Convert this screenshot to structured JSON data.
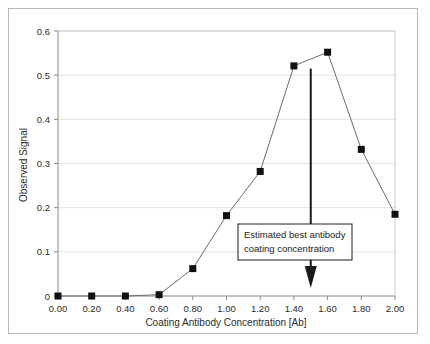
{
  "chart_data": {
    "type": "line",
    "title": "",
    "xlabel": "Coating Antibody Concentration [Ab]",
    "ylabel": "Observed Signal",
    "x": [
      0.0,
      0.2,
      0.4,
      0.6,
      0.8,
      1.0,
      1.2,
      1.4,
      1.6,
      1.8,
      2.0
    ],
    "values": [
      0.0,
      0.0,
      0.0,
      0.003,
      0.062,
      0.182,
      0.282,
      0.521,
      0.552,
      0.332,
      0.185
    ],
    "series": [
      {
        "name": "Observed Signal",
        "values": [
          0.0,
          0.0,
          0.0,
          0.003,
          0.062,
          0.182,
          0.282,
          0.521,
          0.552,
          0.332,
          0.185
        ]
      }
    ],
    "xlim": [
      0.0,
      2.0
    ],
    "ylim": [
      0.0,
      0.6
    ],
    "xticks": [
      "0.00",
      "0.20",
      "0.40",
      "0.60",
      "0.80",
      "1.00",
      "1.20",
      "1.40",
      "1.60",
      "1.80",
      "2.00"
    ],
    "yticks": [
      "0",
      "0.1",
      "0.2",
      "0.3",
      "0.4",
      "0.5",
      "0.6"
    ],
    "ytick_values": [
      0.0,
      0.1,
      0.2,
      0.3,
      0.4,
      0.5,
      0.6
    ],
    "grid": "horizontal",
    "legend": "none",
    "marker": "square",
    "marker_color": "#111111",
    "line_color": "#6b6b6b",
    "grid_color": "#e3e3e3",
    "axis_color": "#8a8a8a",
    "annotations": [
      {
        "name": "estimated-best-concentration",
        "line1": "Estimated best antibody",
        "line2": "coating concentration",
        "arrow_x": 1.5,
        "arrow_y_top": 0.515,
        "arrow_y_bottom": 0.018
      }
    ]
  },
  "axis": {
    "x_title": "Coating Antibody Concentration [Ab]",
    "y_title": "Observed Signal",
    "x_tick_labels": [
      "0.00",
      "0.20",
      "0.40",
      "0.60",
      "0.80",
      "1.00",
      "1.20",
      "1.40",
      "1.60",
      "1.80",
      "2.00"
    ],
    "y_tick_labels": [
      "0",
      "0.1",
      "0.2",
      "0.3",
      "0.4",
      "0.5",
      "0.6"
    ]
  },
  "annotation": {
    "line1": "Estimated best antibody",
    "line2": "coating concentration"
  },
  "colors": {
    "marker": "#111111",
    "line": "#6b6b6b",
    "grid": "#e3e3e3",
    "axis": "#8a8a8a",
    "frame": "#b9b9b9",
    "text": "#2b2b2b",
    "arrow": "#1a1a1a"
  }
}
